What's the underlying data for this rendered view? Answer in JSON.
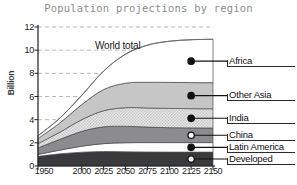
{
  "chart_data": {
    "type": "area",
    "title": "Population projections by region",
    "xlabel": "",
    "ylabel": "Billion",
    "xlim": [
      1950,
      2150
    ],
    "ylim": [
      0,
      12
    ],
    "grid": true,
    "stacked": true,
    "legend_position": "right-outside",
    "annotations": [
      {
        "text": "World total",
        "x": 2020,
        "y": 10.4
      }
    ],
    "x": [
      1950,
      1975,
      2000,
      2025,
      2050,
      2075,
      2100,
      2125,
      2150
    ],
    "xticks": [
      "1950",
      "2000",
      "2025",
      "2050",
      "2075",
      "2100",
      "2125",
      "2150"
    ],
    "xtick_values": [
      1950,
      2000,
      2025,
      2050,
      2075,
      2100,
      2125,
      2150
    ],
    "yticks": [
      "0",
      "2",
      "4",
      "6",
      "8",
      "10",
      "12"
    ],
    "ytick_values": [
      0,
      2,
      4,
      6,
      8,
      10,
      12
    ],
    "series": [
      {
        "name": "Developed",
        "marker": "open-circle",
        "fill": "#3a3a3c",
        "values": [
          0.83,
          1.05,
          1.19,
          1.25,
          1.23,
          1.21,
          1.2,
          1.2,
          1.2
        ]
      },
      {
        "name": "Latin America",
        "marker": "filled-circle",
        "fill": "#ffffff",
        "values": [
          0.17,
          0.32,
          0.52,
          0.68,
          0.78,
          0.81,
          0.82,
          0.82,
          0.82
        ]
      },
      {
        "name": "China",
        "marker": "open-circle",
        "fill": "#8c8c8e",
        "values": [
          0.56,
          0.93,
          1.28,
          1.45,
          1.42,
          1.34,
          1.29,
          1.27,
          1.26
        ]
      },
      {
        "name": "India",
        "marker": "filled-circle",
        "fill": "#dcdcdc",
        "pattern": "stipple",
        "values": [
          0.37,
          0.62,
          1.01,
          1.39,
          1.6,
          1.65,
          1.66,
          1.66,
          1.66
        ]
      },
      {
        "name": "Other Asia",
        "marker": "filled-circle",
        "fill": "#c6c6c6",
        "values": [
          0.44,
          0.8,
          1.3,
          1.83,
          2.12,
          2.22,
          2.25,
          2.25,
          2.25
        ]
      },
      {
        "name": "Africa",
        "marker": "filled-circle",
        "fill": "#ffffff",
        "values": [
          0.23,
          0.42,
          0.8,
          1.6,
          2.5,
          3.2,
          3.55,
          3.7,
          3.75
        ]
      }
    ],
    "world_total": [
      2.6,
      4.14,
      6.1,
      8.2,
      9.65,
      10.43,
      10.77,
      10.9,
      10.94
    ],
    "colors": {
      "title": "#8d8d8d",
      "axis": "#1d1d1d",
      "grid": "#b9b9b9",
      "leader": "#2b2b2b"
    }
  }
}
